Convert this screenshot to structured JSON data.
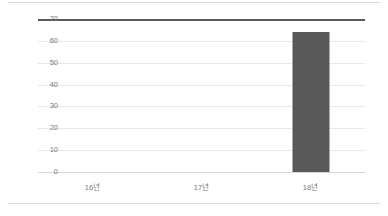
{
  "chart_data": {
    "type": "bar",
    "title": "",
    "subtitle": "",
    "xlabel": "",
    "ylabel": "",
    "categories": [
      "16년",
      "17년",
      "18년"
    ],
    "values": [
      0,
      0,
      64
    ],
    "series": [
      {
        "name": "",
        "values": [
          0,
          0,
          64
        ]
      }
    ],
    "ylim": [
      0,
      70
    ],
    "y_ticks": [
      0,
      10,
      20,
      30,
      40,
      50,
      60,
      70
    ],
    "y_tick_labels": [
      "0",
      "10",
      "20",
      "30",
      "40",
      "50",
      "60",
      "70"
    ],
    "grid": true,
    "grid_axis": "y",
    "legend": false,
    "legend_position": "none",
    "colors": {
      "bar": "#595959",
      "gridline": "#e8e8e8",
      "axis_top_line": "#595959",
      "baseline": "#d5d5d5",
      "frame": "#d9d9d9",
      "tick_label": "#7b7b7b",
      "background": "#ffffff"
    }
  }
}
